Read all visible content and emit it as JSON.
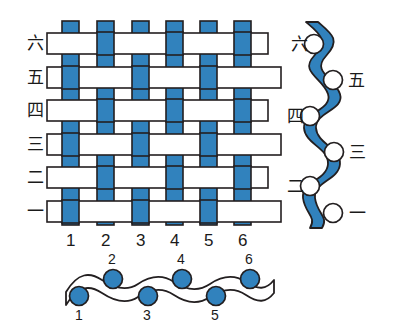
{
  "figure": {
    "colors": {
      "warp_weft_blue": "#3182bd",
      "blue_dark_edge": "#2a6ea5",
      "outline": "#231f20",
      "white": "#ffffff",
      "background": "#ffffff"
    }
  },
  "main_weave": {
    "name": "plain-weave-grid",
    "row_labels": [
      "六",
      "五",
      "四",
      "三",
      "二",
      "一"
    ],
    "row_labels_top_to_bottom": true,
    "column_labels": [
      "1",
      "2",
      "3",
      "4",
      "5",
      "6"
    ],
    "warp_count": 6,
    "weft_count": 6,
    "weft_color": "#ffffff",
    "warp_color": "#3182bd",
    "pattern_note": "plain weave: odd warps float over odd wefts, even warps float over even wefts",
    "rows": [
      {
        "label": "六",
        "index": 6,
        "warps_in_front": [
          2,
          4,
          6
        ]
      },
      {
        "label": "五",
        "index": 5,
        "warps_in_front": [
          1,
          3,
          5
        ]
      },
      {
        "label": "四",
        "index": 4,
        "warps_in_front": [
          2,
          4,
          6
        ]
      },
      {
        "label": "三",
        "index": 3,
        "warps_in_front": [
          1,
          3,
          5
        ]
      },
      {
        "label": "二",
        "index": 2,
        "warps_in_front": [
          2,
          4,
          6
        ]
      },
      {
        "label": "一",
        "index": 1,
        "warps_in_front": [
          1,
          3,
          5
        ]
      }
    ]
  },
  "right_diagram": {
    "name": "warp-thread-cross-section",
    "thread_color": "#3182bd",
    "orientation": "vertical",
    "node_color": "#ffffff",
    "nodes": [
      {
        "label": "六",
        "side": "left"
      },
      {
        "label": "五",
        "side": "right"
      },
      {
        "label": "四",
        "side": "left"
      },
      {
        "label": "三",
        "side": "right"
      },
      {
        "label": "二",
        "side": "left"
      },
      {
        "label": "一",
        "side": "right"
      }
    ]
  },
  "bottom_diagram": {
    "name": "weft-thread-cross-section",
    "thread_color": "#ffffff",
    "orientation": "horizontal",
    "node_color": "#3182bd",
    "nodes": [
      {
        "label": "1",
        "side": "below"
      },
      {
        "label": "2",
        "side": "above"
      },
      {
        "label": "3",
        "side": "below"
      },
      {
        "label": "4",
        "side": "above"
      },
      {
        "label": "5",
        "side": "below"
      },
      {
        "label": "6",
        "side": "above"
      }
    ]
  }
}
